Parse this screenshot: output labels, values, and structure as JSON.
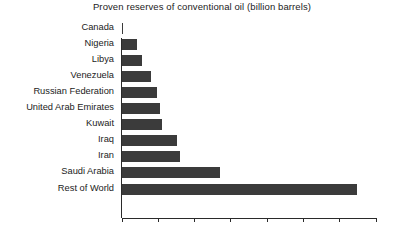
{
  "chart_data": {
    "type": "bar",
    "orientation": "horizontal",
    "title": "Proven reserves of conventional oil (billion barrels)",
    "xlabel": "",
    "ylabel": "",
    "xlim": [
      0,
      700
    ],
    "xticks": [
      0,
      100,
      200,
      300,
      400,
      500,
      600,
      700
    ],
    "grid": false,
    "legend": null,
    "bar_color": "#3b3b3b",
    "categories": [
      "Canada",
      "Nigeria",
      "Libya",
      "Venezuela",
      "Russian Federation",
      "United Arab Emirates",
      "Kuwait",
      "Iraq",
      "Iran",
      "Saudi Arabia",
      "Rest of World"
    ],
    "values": [
      5,
      42,
      56,
      80,
      97,
      105,
      112,
      152,
      160,
      271,
      648
    ]
  }
}
